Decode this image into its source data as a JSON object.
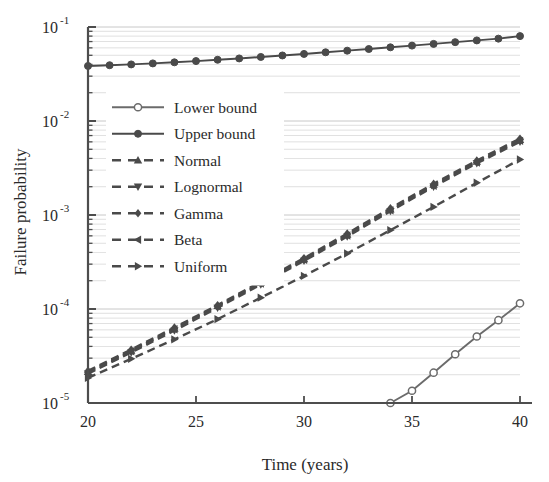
{
  "chart_data": {
    "type": "line",
    "title": "",
    "xlabel": "Time (years)",
    "ylabel": "Failure probability",
    "xlim": [
      20,
      40
    ],
    "ylim": [
      1e-05,
      0.1
    ],
    "yscale": "log",
    "grid": "minor-horizontal",
    "legend_position": "center-left",
    "xticks": [
      20,
      25,
      30,
      35,
      40
    ],
    "xtick_labels": [
      "20",
      "25",
      "30",
      "35",
      "40"
    ],
    "yticks": [
      1e-05,
      0.0001,
      0.001,
      0.01,
      0.1
    ],
    "ytick_labels": [
      "10-5",
      "10-4",
      "10-3",
      "10-2",
      "10-1"
    ],
    "ytick_mantissas": [
      "10",
      "10",
      "10",
      "10",
      "10"
    ],
    "ytick_exponents": [
      "-5",
      "-4",
      "-3",
      "-2",
      "-1"
    ],
    "x": [
      20,
      21,
      22,
      23,
      24,
      25,
      26,
      27,
      28,
      29,
      30,
      31,
      32,
      33,
      34,
      35,
      36,
      37,
      38,
      39,
      40
    ],
    "series": [
      {
        "name": "Lower bound",
        "marker": "circle-open",
        "linestyle": "solid",
        "color": "#6b6b6b",
        "x": [
          34,
          35,
          36,
          37,
          38,
          39,
          40
        ],
        "values": [
          1e-05,
          1.35e-05,
          2.1e-05,
          3.3e-05,
          5.1e-05,
          7.6e-05,
          0.000115
        ]
      },
      {
        "name": "Upper bound",
        "marker": "circle-filled",
        "linestyle": "solid",
        "color": "#4a4a4a",
        "x": [
          20,
          21,
          22,
          23,
          24,
          25,
          26,
          27,
          28,
          29,
          30,
          31,
          32,
          33,
          34,
          35,
          36,
          37,
          38,
          39,
          40
        ],
        "values": [
          0.0385,
          0.0392,
          0.04,
          0.041,
          0.0421,
          0.0434,
          0.0448,
          0.0463,
          0.048,
          0.0498,
          0.0517,
          0.0538,
          0.056,
          0.0583,
          0.0608,
          0.0634,
          0.0661,
          0.069,
          0.072,
          0.0752,
          0.08
        ]
      },
      {
        "name": "Normal",
        "marker": "triangle-up",
        "linestyle": "dashed",
        "color": "#4a4a4a",
        "x": [
          20,
          22,
          24,
          26,
          28,
          30,
          32,
          34,
          36,
          38,
          40
        ],
        "values": [
          2.15e-05,
          3.6e-05,
          6.2e-05,
          0.000108,
          0.00019,
          0.00034,
          0.00062,
          0.00115,
          0.0021,
          0.0037,
          0.0063
        ]
      },
      {
        "name": "Lognormal",
        "marker": "triangle-down",
        "linestyle": "dashed",
        "color": "#4a4a4a",
        "x": [
          20,
          22,
          24,
          26,
          28,
          30,
          32,
          34,
          36,
          38,
          40
        ],
        "values": [
          2.05e-05,
          3.45e-05,
          5.9e-05,
          0.000103,
          0.000182,
          0.000325,
          0.00059,
          0.0011,
          0.002,
          0.00355,
          0.006
        ]
      },
      {
        "name": "Gamma",
        "marker": "diamond",
        "linestyle": "dashed",
        "color": "#4a4a4a",
        "x": [
          20,
          22,
          24,
          26,
          28,
          30,
          32,
          34,
          36,
          38,
          40
        ],
        "values": [
          2.2e-05,
          3.7e-05,
          6.35e-05,
          0.00011,
          0.000195,
          0.000348,
          0.000635,
          0.00118,
          0.00215,
          0.0038,
          0.0065
        ]
      },
      {
        "name": "Beta",
        "marker": "triangle-left",
        "linestyle": "dashed",
        "color": "#4a4a4a",
        "x": [
          20,
          22,
          24,
          26,
          28,
          30,
          32,
          34,
          36,
          38,
          40
        ],
        "values": [
          2.1e-05,
          3.55e-05,
          6.1e-05,
          0.000106,
          0.000187,
          0.000333,
          0.000605,
          0.00112,
          0.00205,
          0.00362,
          0.00615
        ]
      },
      {
        "name": "Uniform",
        "marker": "triangle-right",
        "linestyle": "dashed",
        "color": "#4a4a4a",
        "x": [
          20,
          22,
          24,
          26,
          28,
          30,
          32,
          34,
          36,
          38,
          40
        ],
        "values": [
          1.85e-05,
          2.95e-05,
          4.75e-05,
          7.8e-05,
          0.000132,
          0.000225,
          0.00039,
          0.00069,
          0.00122,
          0.0022,
          0.0039
        ]
      }
    ]
  },
  "axes": {
    "xlabel": "Time (years)",
    "ylabel": "Failure probability"
  },
  "legend": {
    "items": [
      {
        "label": "Lower bound"
      },
      {
        "label": "Upper bound"
      },
      {
        "label": "Normal"
      },
      {
        "label": "Lognormal"
      },
      {
        "label": "Gamma"
      },
      {
        "label": "Beta"
      },
      {
        "label": "Uniform"
      }
    ]
  },
  "colors": {
    "line_dark": "#4a4a4a",
    "line_light": "#6b6b6b",
    "grid": "#b9b9b9",
    "axis": "#4d4d4d",
    "text": "#2a2a2a",
    "background": "#ffffff"
  }
}
